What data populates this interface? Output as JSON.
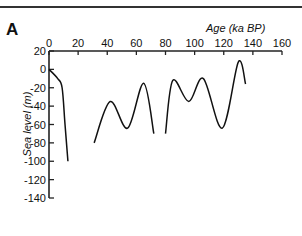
{
  "panel_label": "A",
  "chart_data": {
    "type": "line",
    "title": "",
    "xlabel": "Age (ka BP)",
    "ylabel": "Sea level (m)",
    "xlim": [
      0,
      160
    ],
    "ylim": [
      -140,
      20
    ],
    "x_ticks": [
      0,
      20,
      40,
      60,
      80,
      100,
      120,
      140,
      160
    ],
    "y_ticks": [
      20,
      0,
      -20,
      -40,
      -60,
      -80,
      -100,
      -120,
      -140
    ],
    "x_axis_position": "top",
    "grid": false,
    "legend": null,
    "series": [
      {
        "name": "segment-1",
        "x": [
          0,
          6,
          9,
          11,
          13
        ],
        "y": [
          0,
          -10,
          -20,
          -60,
          -100
        ]
      },
      {
        "name": "segment-2",
        "x": [
          31,
          42,
          54,
          65,
          72
        ],
        "y": [
          -80,
          -35,
          -64,
          -15,
          -70
        ]
      },
      {
        "name": "segment-3",
        "x": [
          80,
          85,
          96,
          106,
          119,
          130,
          135
        ],
        "y": [
          -70,
          -12,
          -35,
          -10,
          -64,
          8,
          -16
        ]
      }
    ]
  }
}
